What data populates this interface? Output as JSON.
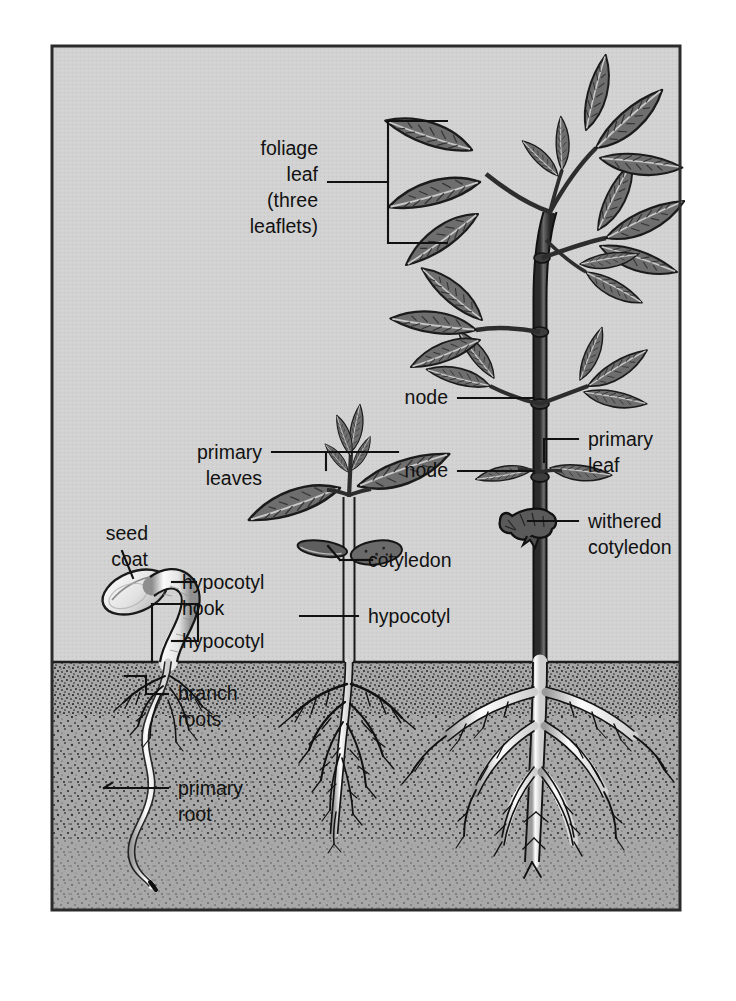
{
  "figure": {
    "frame": {
      "x": 52,
      "y": 46,
      "width": 628,
      "height": 864
    },
    "colors": {
      "page_background": "#ffffff",
      "air_background": "#d2d2d2",
      "soil_background": "#a8a8a8",
      "frame_border": "#2b2b2b",
      "ink": "#111111",
      "leaf_fill": "#6e6e6e",
      "leaf_outline": "#1b1b1b",
      "stem_fill": "#4a4a4a",
      "root_fill": "#f2f2f2",
      "seed_fill": "#e6e6e6",
      "withered_fill": "#5a5a5a"
    },
    "soil_line_y": 662
  },
  "labels": [
    {
      "id": "foliage-leaf",
      "text_lines": [
        "foliage",
        "leaf",
        "(three",
        "leaflets)"
      ],
      "align": "right",
      "text_x": 318,
      "text_y": 155,
      "line_height": 26,
      "annotation": "bracket"
    },
    {
      "id": "node-upper",
      "text_lines": [
        "node"
      ],
      "align": "right",
      "text_x": 448,
      "text_y": 404,
      "line_height": 26,
      "annotation": "leader"
    },
    {
      "id": "node-lower",
      "text_lines": [
        "node"
      ],
      "align": "right",
      "text_x": 448,
      "text_y": 477,
      "line_height": 26,
      "annotation": "leader"
    },
    {
      "id": "primary-leaves",
      "text_lines": [
        "primary",
        "leaves"
      ],
      "align": "right",
      "text_x": 262,
      "text_y": 459,
      "line_height": 26,
      "annotation": "bracket"
    },
    {
      "id": "primary-leaf",
      "text_lines": [
        "primary",
        "leaf"
      ],
      "align": "left",
      "text_x": 588,
      "text_y": 446,
      "line_height": 26,
      "annotation": "leader"
    },
    {
      "id": "withered-cotyledon",
      "text_lines": [
        "withered",
        "cotyledon"
      ],
      "align": "left",
      "text_x": 588,
      "text_y": 528,
      "line_height": 26,
      "annotation": "leader"
    },
    {
      "id": "seed-coat",
      "text_lines": [
        "seed",
        "coat"
      ],
      "align": "right",
      "text_x": 148,
      "text_y": 540,
      "line_height": 26,
      "annotation": "leader"
    },
    {
      "id": "hypocotyl-hook",
      "text_lines": [
        "hypocotyl",
        "hook"
      ],
      "align": "left",
      "text_x": 182,
      "text_y": 589,
      "line_height": 26,
      "annotation": "leader"
    },
    {
      "id": "hypocotyl-seed",
      "text_lines": [
        "hypocotyl"
      ],
      "align": "left",
      "text_x": 182,
      "text_y": 648,
      "line_height": 26,
      "annotation": "bracket"
    },
    {
      "id": "branch-roots",
      "text_lines": [
        "branch",
        "roots"
      ],
      "align": "left",
      "text_x": 178,
      "text_y": 700,
      "line_height": 26,
      "annotation": "bracket"
    },
    {
      "id": "primary-root",
      "text_lines": [
        "primary",
        "root"
      ],
      "align": "left",
      "text_x": 178,
      "text_y": 795,
      "line_height": 26,
      "annotation": "leader"
    },
    {
      "id": "cotyledon",
      "text_lines": [
        "cotyledon"
      ],
      "align": "left",
      "text_x": 368,
      "text_y": 567,
      "line_height": 26,
      "annotation": "leader"
    },
    {
      "id": "hypocotyl-seedling",
      "text_lines": [
        "hypocotyl"
      ],
      "align": "left",
      "text_x": 368,
      "text_y": 623,
      "line_height": 26,
      "annotation": "leader"
    }
  ],
  "specimens": [
    {
      "id": "germinating-seed",
      "name": "germinating seed",
      "stage": 1,
      "parts": [
        "seed coat",
        "hypocotyl hook",
        "hypocotyl",
        "branch roots",
        "primary root"
      ]
    },
    {
      "id": "young-seedling",
      "name": "young seedling",
      "stage": 2,
      "parts": [
        "primary leaves",
        "cotyledon",
        "hypocotyl",
        "branch roots",
        "primary root"
      ]
    },
    {
      "id": "mature-plant",
      "name": "mature plant",
      "stage": 3,
      "parts": [
        "foliage leaf (three leaflets)",
        "node",
        "primary leaf",
        "withered cotyledon",
        "root system"
      ]
    }
  ]
}
